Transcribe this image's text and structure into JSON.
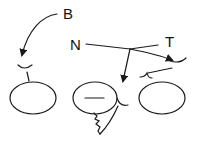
{
  "diagram": {
    "labels": {
      "B": "B",
      "N": "N",
      "T": "T"
    },
    "stroke_color": "#1a1a1a",
    "background": "#ffffff"
  }
}
